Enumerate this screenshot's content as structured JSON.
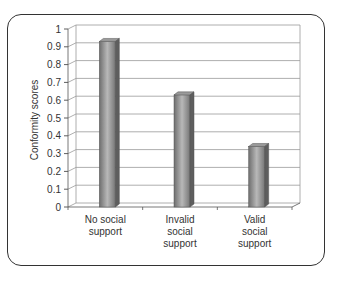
{
  "chart_data": {
    "type": "bar",
    "title": "",
    "xlabel": "",
    "ylabel": "Conformity scores",
    "categories": [
      "No social support",
      "Invalid social support",
      "Valid social support"
    ],
    "category_lines": [
      [
        "No social",
        "support"
      ],
      [
        "Invalid",
        "social",
        "support"
      ],
      [
        "Valid",
        "social",
        "support"
      ]
    ],
    "values": [
      0.93,
      0.63,
      0.34
    ],
    "ylim": [
      0,
      1
    ],
    "yticks": [
      "0",
      "0.1",
      "0.2",
      "0.3",
      "0.4",
      "0.5",
      "0.6",
      "0.7",
      "0.8",
      "0.9",
      "1"
    ],
    "grid": true,
    "legend": null,
    "style": "3d-column",
    "bar_color": "#8a8a8a"
  }
}
